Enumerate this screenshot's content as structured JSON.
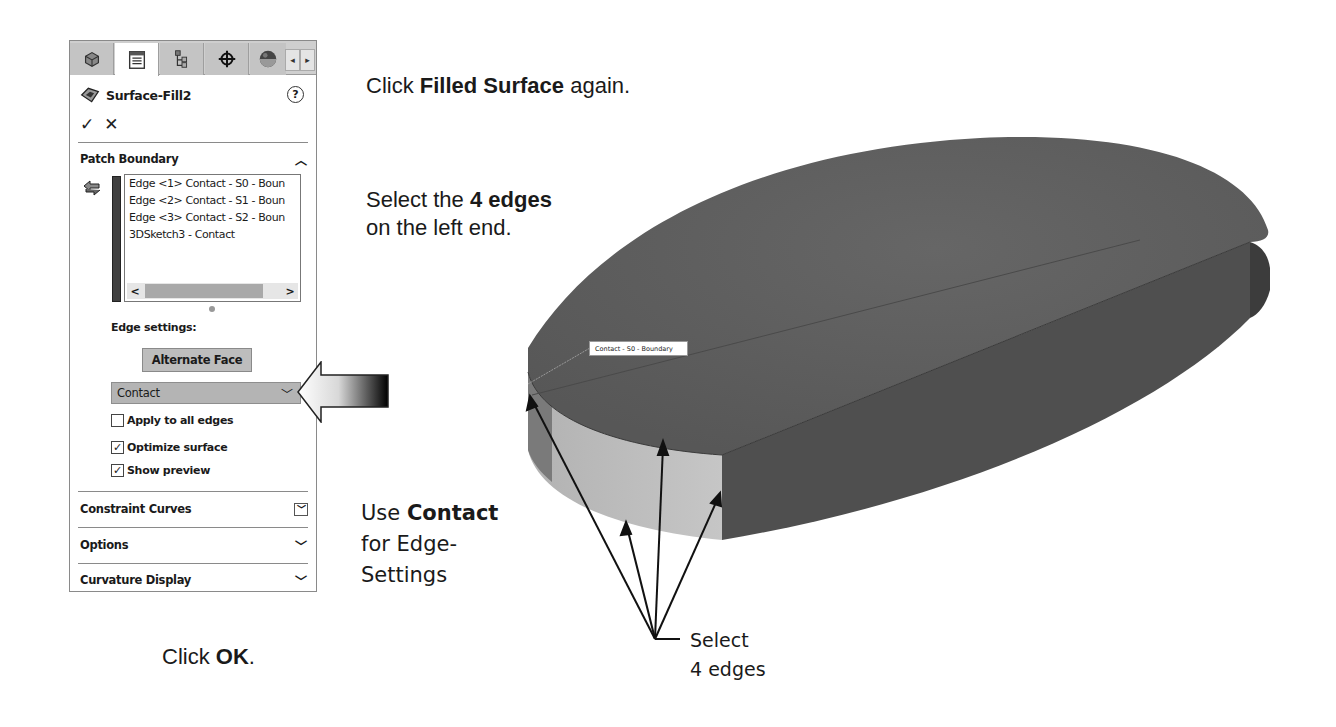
{
  "panel": {
    "tabs": [
      {
        "name": "feature-manager",
        "icon": "part-icon",
        "active": false
      },
      {
        "name": "property-manager",
        "icon": "property-list-icon",
        "active": true
      },
      {
        "name": "configuration-manager",
        "icon": "configuration-tree-icon",
        "active": false
      },
      {
        "name": "dimxpert-manager",
        "icon": "crosshair-icon",
        "active": false
      },
      {
        "name": "display-manager",
        "icon": "appearance-sphere-icon",
        "active": false
      }
    ],
    "tab_scroll_left": "◂",
    "tab_scroll_right": "▸",
    "title": "Surface-Fill2",
    "help": "?",
    "ok_symbol": "✓",
    "cancel_symbol": "✕",
    "patch_boundary": {
      "header": "Patch Boundary",
      "header_underline_char": "B",
      "items": [
        "Edge <1> Contact - S0 - Boun",
        "Edge <2> Contact - S1 - Boun",
        "Edge <3> Contact - S2 - Boun",
        "3DSketch3 - Contact"
      ],
      "scroll_left": "<",
      "scroll_right": ">",
      "edge_settings_label": "Edge settings:",
      "alternate_face_button": "Alternate Face",
      "edge_setting_value": "Contact",
      "apply_to_all_edges": {
        "label": "Apply to all edges",
        "checked": false
      },
      "optimize_surface": {
        "label": "Optimize surface",
        "checked": true
      },
      "show_preview": {
        "label": "Show preview",
        "checked": true
      }
    },
    "sections": [
      {
        "label": "Constraint Curves",
        "expanded": false,
        "boxed_chevron": true
      },
      {
        "label": "Options",
        "expanded": false
      },
      {
        "label": "Curvature Display",
        "expanded": false
      }
    ]
  },
  "instructions": {
    "step1": {
      "pre": "Click ",
      "bold": "Filled Surface",
      "post": " again."
    },
    "step2": {
      "line1_pre": "Select the ",
      "line1_bold": "4 edges",
      "line2": "on the left end."
    },
    "step3": {
      "pre": "Use ",
      "bold": "Contact",
      "line2": "for Edge-",
      "line3": "Settings"
    },
    "step4": {
      "pre": "Click ",
      "bold": "OK",
      "post": "."
    },
    "select_label_line1": "Select",
    "select_label_line2": "4 edges"
  },
  "viewport": {
    "edge_tooltip": "Contact - S0 - Boundary",
    "colors": {
      "top_face": "#5e5e5e",
      "side_face_dark": "#4f4f4f",
      "side_face_light": "#bdbdbd",
      "end_face": "#3e3e3e"
    }
  }
}
